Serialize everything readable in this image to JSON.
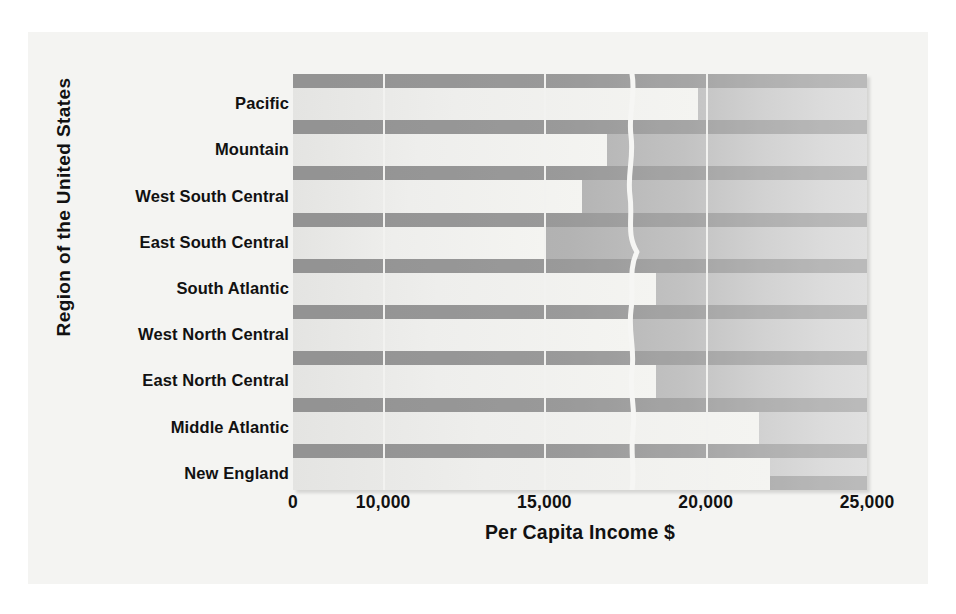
{
  "chart_data": {
    "type": "bar",
    "orientation": "horizontal",
    "title": "",
    "xlabel": "Per Capita Income $",
    "ylabel": "Region of the United States",
    "categories": [
      "Pacific",
      "Mountain",
      "West South Central",
      "East South Central",
      "South Atlantic",
      "West North Central",
      "East North Central",
      "Middle Atlantic",
      "New England"
    ],
    "values": [
      19750,
      16950,
      16150,
      15000,
      18450,
      17650,
      18450,
      21650,
      22000
    ],
    "xlim": [
      0,
      25000
    ],
    "axis_break": {
      "present": true,
      "between": [
        0,
        8600
      ],
      "style": "wavy-white-line"
    },
    "xticks": [
      0,
      10000,
      15000,
      20000,
      25000
    ],
    "xtick_labels": [
      "0",
      "10,000",
      "15,000",
      "20,000",
      "25,000"
    ],
    "grid": "vertical-gridlines-at-ticks",
    "legend": "none",
    "colors": {
      "bar_fill": "#f0f0ee",
      "plot_background_left": "#a9a9a9",
      "plot_background_right": "#e0e0e0",
      "row_band": "#8f8f8f",
      "gridline": "#f2f2f0",
      "page_background": "#f4f4f2",
      "text": "#111111"
    }
  }
}
